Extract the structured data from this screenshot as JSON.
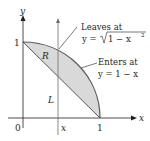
{
  "diagram": {
    "axes": {
      "x_label": "x",
      "y_label": "y",
      "origin_label": "0",
      "x_tick_label": "1",
      "y_tick_label": "1",
      "x_marker_label": "x"
    },
    "region": {
      "label": "R",
      "fill": "#d9d9d9",
      "upper_curve": "y = sqrt(1 - x^2)",
      "lower_curve": "y = 1 - x"
    },
    "line_label": "L",
    "annotations": {
      "leaves_title": "Leaves at",
      "leaves_eq_prefix": "y = ",
      "leaves_eq_radicand": "1 − x",
      "leaves_eq_exp": "2",
      "enters_title": "Enters at",
      "enters_eq": "y = 1 − x"
    },
    "colors": {
      "stroke": "#231f20",
      "curve": "#58595b",
      "region": "#d9d9d9"
    }
  }
}
